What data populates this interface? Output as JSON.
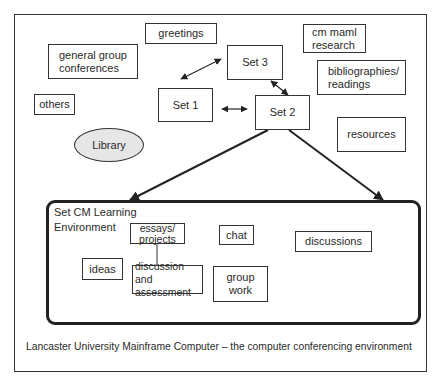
{
  "diagram": {
    "caption": "Lancaster University Mainframe Computer – the computer conferencing environment",
    "outer_nodes": {
      "greetings": "greetings",
      "general_group_conferences": "general group\nconferences",
      "others": "others",
      "library": "Library",
      "cm_maml_research": "cm maml\nresearch",
      "bibliographies_readings": "bibliographies/\nreadings",
      "resources": "resources",
      "set1": "Set 1",
      "set2": "Set 2",
      "set3": "Set 3"
    },
    "learning_environment": {
      "title": "Set CM Learning\nEnvironment",
      "nodes": {
        "essays_projects": "essays/\nprojects",
        "chat": "chat",
        "discussions": "discussions",
        "ideas": "ideas",
        "discussion_assessment": "discussion and\nassessment",
        "group_work": "group\nwork"
      }
    },
    "edges": [
      {
        "from": "Set 1",
        "to": "Set 3",
        "type": "bidirectional"
      },
      {
        "from": "Set 1",
        "to": "Set 2",
        "type": "bidirectional"
      },
      {
        "from": "Set 3",
        "to": "Set 2",
        "type": "bidirectional"
      },
      {
        "from": "Set 2",
        "to": "Set CM Learning Environment",
        "type": "arrow",
        "count": 2
      },
      {
        "from": "essays/projects",
        "to": "discussion and assessment",
        "type": "line"
      }
    ]
  }
}
